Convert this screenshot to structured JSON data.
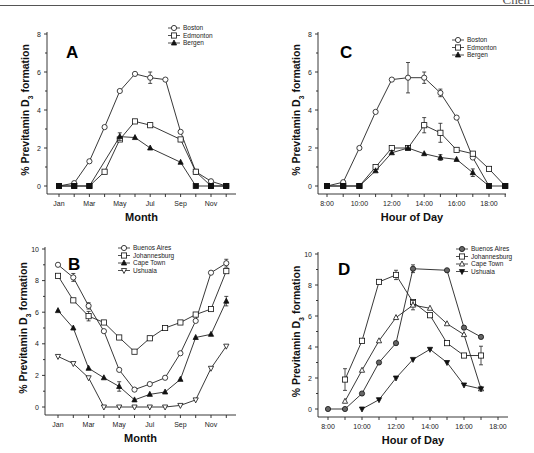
{
  "page": {
    "running_head": "Chen"
  },
  "chart_data": [
    {
      "id": "A",
      "type": "line",
      "panel_label": "A",
      "title": "",
      "xlabel": "Month",
      "ylabel": "% Previtamin D3 formation",
      "ylim": [
        0,
        8
      ],
      "yticks": [
        0,
        2,
        4,
        6,
        8
      ],
      "categories": [
        "Jan",
        "Feb",
        "Mar",
        "Apr",
        "May",
        "Jun",
        "Jul",
        "Aug",
        "Sep",
        "Oct",
        "Nov",
        "Dec"
      ],
      "xtick_labels": [
        "Jan",
        "",
        "Mar",
        "",
        "May",
        "",
        "Jul",
        "",
        "Sep",
        "",
        "Nov",
        ""
      ],
      "grid": false,
      "legend_position": "upper right",
      "series": [
        {
          "name": "Boston",
          "marker": "circle-open",
          "values": [
            0,
            0.15,
            1.3,
            3.1,
            5.0,
            5.9,
            5.7,
            5.6,
            2.85,
            0.75,
            0.25,
            0
          ],
          "errors": [
            0,
            0,
            0,
            0,
            0,
            0,
            0.3,
            0,
            0,
            0,
            0,
            0
          ]
        },
        {
          "name": "Edmonton",
          "marker": "square-open",
          "values": [
            0,
            0,
            0,
            0.75,
            2.45,
            3.4,
            3.2,
            null,
            2.45,
            0.75,
            0,
            0
          ],
          "errors": [
            0,
            0,
            0,
            0,
            0,
            0,
            0,
            0,
            0,
            0,
            0,
            0
          ]
        },
        {
          "name": "Bergen",
          "marker": "triangle-filled",
          "values": [
            0,
            0,
            0,
            null,
            2.6,
            2.55,
            2.0,
            null,
            1.25,
            0,
            0,
            0
          ],
          "errors": [
            0,
            0,
            0,
            0,
            0.2,
            0,
            0,
            0,
            0,
            0,
            0,
            0
          ]
        }
      ]
    },
    {
      "id": "C",
      "type": "line",
      "panel_label": "C",
      "title": "",
      "xlabel": "Hour of Day",
      "ylabel": "% Previtamin D3 formation",
      "ylim": [
        0,
        8
      ],
      "yticks": [
        0,
        2,
        4,
        6,
        8
      ],
      "categories": [
        "8:00",
        "9:00",
        "10:00",
        "11:00",
        "12:00",
        "13:00",
        "14:00",
        "15:00",
        "16:00",
        "17:00",
        "18:00",
        "19:00"
      ],
      "xtick_labels": [
        "8:00",
        "",
        "10:00",
        "",
        "12:00",
        "",
        "14:00",
        "",
        "16:00",
        "",
        "18:00",
        ""
      ],
      "grid": false,
      "legend_position": "upper right",
      "series": [
        {
          "name": "Boston",
          "marker": "circle-open",
          "values": [
            0,
            0.2,
            2.0,
            3.9,
            5.6,
            5.7,
            5.7,
            4.9,
            3.6,
            1.5,
            0,
            null
          ],
          "errors": [
            0,
            0,
            0,
            0,
            0,
            0.8,
            0.3,
            0.2,
            0,
            0,
            0,
            0
          ]
        },
        {
          "name": "Edmonton",
          "marker": "square-open",
          "values": [
            0,
            0,
            0,
            1.0,
            2.0,
            2.0,
            3.2,
            2.8,
            1.9,
            1.7,
            0.9,
            0
          ],
          "errors": [
            0,
            0,
            0,
            0,
            0,
            0,
            0.4,
            0.5,
            0,
            0,
            0,
            0
          ]
        },
        {
          "name": "Bergen",
          "marker": "triangle-filled",
          "values": [
            0,
            0,
            0,
            0.8,
            1.75,
            2.0,
            1.7,
            1.5,
            1.4,
            0.7,
            0,
            0
          ],
          "errors": [
            0,
            0,
            0,
            0,
            0,
            0,
            0,
            0.15,
            0,
            0.2,
            0,
            0
          ]
        }
      ]
    },
    {
      "id": "B",
      "type": "line",
      "panel_label": "B",
      "title": "",
      "xlabel": "Month",
      "ylabel": "% Previtamin D3 formation",
      "ylim": [
        0,
        10
      ],
      "yticks": [
        0,
        2,
        4,
        6,
        8,
        10
      ],
      "categories": [
        "Jan",
        "Feb",
        "Mar",
        "Apr",
        "May",
        "Jun",
        "Jul",
        "Aug",
        "Sep",
        "Oct",
        "Nov",
        "Dec"
      ],
      "xtick_labels": [
        "Jan",
        "",
        "Mar",
        "",
        "May",
        "",
        "Jul",
        "",
        "Sep",
        "",
        "Nov",
        ""
      ],
      "grid": false,
      "legend_position": "upper center",
      "series": [
        {
          "name": "Buenos Aires",
          "marker": "circle-open",
          "values": [
            9.0,
            8.2,
            6.4,
            4.8,
            2.35,
            1.1,
            1.45,
            1.85,
            3.4,
            5.45,
            8.5,
            9.1
          ],
          "errors": [
            0,
            0.25,
            0.2,
            0,
            0,
            0,
            0,
            0,
            0,
            0,
            0,
            0.25
          ]
        },
        {
          "name": "Johannesburg",
          "marker": "square-open",
          "values": [
            8.3,
            6.75,
            5.75,
            5.35,
            4.4,
            3.5,
            4.35,
            5.0,
            5.35,
            5.85,
            6.2,
            8.6
          ],
          "errors": [
            0,
            0,
            0.3,
            0,
            0,
            0,
            0,
            0,
            0,
            0,
            0,
            0
          ]
        },
        {
          "name": "Cape Town",
          "marker": "triangle-filled",
          "values": [
            6.1,
            5.0,
            2.45,
            1.85,
            1.3,
            0.45,
            0.8,
            0.95,
            1.75,
            4.4,
            4.6,
            6.7
          ],
          "errors": [
            0,
            0,
            0,
            0,
            0.3,
            0,
            0,
            0,
            0,
            0,
            0,
            0.3
          ]
        },
        {
          "name": "Ushuaia",
          "marker": "triangle-down-open",
          "values": [
            3.2,
            2.75,
            1.85,
            0,
            0,
            0,
            0,
            0,
            0.1,
            0.45,
            2.45,
            3.85
          ],
          "errors": [
            0,
            0,
            0,
            0,
            0,
            0,
            0,
            0,
            0,
            0,
            0,
            0
          ]
        }
      ]
    },
    {
      "id": "D",
      "type": "line",
      "panel_label": "D",
      "title": "",
      "xlabel": "Hour of Day",
      "ylabel": "% Previtamin D3 formation",
      "ylim": [
        0,
        10
      ],
      "yticks": [
        0,
        2,
        4,
        6,
        8,
        10
      ],
      "categories": [
        "8:00",
        "9:00",
        "10:00",
        "11:00",
        "12:00",
        "13:00",
        "14:00",
        "15:00",
        "16:00",
        "17:00",
        "18:00"
      ],
      "xtick_labels": [
        "8:00",
        "",
        "10:00",
        "",
        "12:00",
        "",
        "14:00",
        "",
        "16:00",
        "",
        "18:00"
      ],
      "grid": false,
      "legend_position": "upper right",
      "series": [
        {
          "name": "Buenos Aires",
          "marker": "circle-gray",
          "values": [
            0,
            0,
            1.0,
            3.0,
            4.25,
            9.05,
            null,
            8.95,
            5.25,
            4.65,
            null
          ],
          "errors": [
            0,
            0,
            0,
            0,
            0,
            0.25,
            0,
            0,
            0,
            0,
            0
          ]
        },
        {
          "name": "Johannesburg",
          "marker": "square-open",
          "values": [
            null,
            1.9,
            4.4,
            8.2,
            8.65,
            6.9,
            6.05,
            4.25,
            3.45,
            3.45,
            null
          ],
          "errors": [
            0,
            0.7,
            0,
            0,
            0.3,
            0,
            0,
            0,
            0,
            0.6,
            0
          ]
        },
        {
          "name": "Cape Town",
          "marker": "triangle-open",
          "values": [
            null,
            0.5,
            2.5,
            4.4,
            5.9,
            6.7,
            6.5,
            5.5,
            4.8,
            1.3,
            null
          ],
          "errors": [
            0,
            0,
            0,
            0,
            0,
            0.3,
            0,
            0,
            0,
            0,
            0
          ]
        },
        {
          "name": "Ushuaia",
          "marker": "triangle-down-filled",
          "values": [
            null,
            null,
            0,
            0.6,
            2.0,
            3.2,
            3.85,
            3.0,
            1.55,
            1.3,
            null
          ],
          "errors": [
            0,
            0,
            0,
            0,
            0,
            0,
            0,
            0,
            0,
            0,
            0
          ]
        }
      ]
    }
  ],
  "layout": {
    "A": {
      "x0": 59,
      "dx": 15.2,
      "yBase": 186,
      "yTop": 34,
      "axisX": 47,
      "axisY": 194,
      "xEnd": 236,
      "letter": [
        66,
        58
      ],
      "legend": [
        178,
        28
      ]
    },
    "C": {
      "x0": 327,
      "dx": 16.2,
      "yBase": 186,
      "yTop": 34,
      "axisX": 318,
      "axisY": 194,
      "xEnd": 506,
      "letter": [
        340,
        58
      ],
      "legend": [
        462,
        40
      ]
    },
    "B": {
      "x0": 58,
      "dx": 15.3,
      "yBase": 407,
      "yTop": 249,
      "axisX": 45,
      "axisY": 415,
      "xEnd": 236,
      "letter": [
        68,
        270
      ],
      "legend": [
        128,
        248
      ]
    },
    "D": {
      "x0": 328,
      "dx": 17.0,
      "yBase": 409,
      "yTop": 254,
      "axisX": 318,
      "axisY": 417,
      "xEnd": 508,
      "letter": [
        338,
        275
      ],
      "legend": [
        466,
        249
      ]
    }
  }
}
